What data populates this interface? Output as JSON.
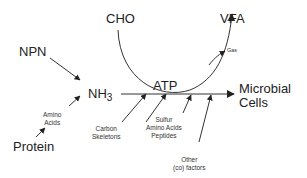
{
  "diagram": {
    "nodes": {
      "cho": "CHO",
      "vfa": "VFA",
      "npn": "NPN",
      "nh3_base": "NH",
      "nh3_sub": "3",
      "atp": "ATP",
      "microbial_line1": "Microbial",
      "microbial_line2": "Cells",
      "protein": "Protein"
    },
    "edge_labels": {
      "gas": "Gas",
      "amino_acids_line1": "Amino",
      "amino_acids_line2": "Acids",
      "carbon_skeletons_line1": "Carbon",
      "carbon_skeletons_line2": "Skeletons",
      "sulfur_line1": "Sulfur",
      "sulfur_line2": "Amino Acids",
      "sulfur_line3": "Peptides",
      "other_line1": "Other",
      "other_line2": "(co) factors"
    },
    "colors": {
      "line": "#333333",
      "text": "#222222"
    }
  }
}
